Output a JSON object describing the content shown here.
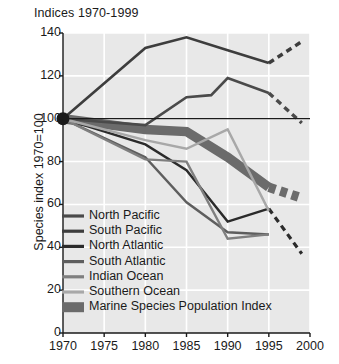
{
  "chart_data": {
    "type": "line",
    "title": "Indices 1970-1999",
    "xlabel": "",
    "ylabel": "Species index 1970=100",
    "xlim": [
      1970,
      2000
    ],
    "ylim": [
      0,
      140
    ],
    "grid": true,
    "grid_color": "#ffffff",
    "plot_background": "#e8e8e8",
    "legend_position": "inside-lower-left",
    "xticks": [
      1970,
      1975,
      1980,
      1985,
      1990,
      1995,
      2000
    ],
    "yticks": [
      0,
      20,
      40,
      60,
      80,
      100,
      120,
      140
    ],
    "reference_line": {
      "y": 100,
      "color": "#1a1a1a",
      "label": ""
    },
    "marker_points": [
      {
        "x": 1970,
        "y": 100,
        "color": "#1a1a1a"
      }
    ],
    "series": [
      {
        "name": "North Pacific",
        "color": "#4a4a4a",
        "width": 2.6,
        "x": [
          1970,
          1980,
          1985,
          1988,
          1990,
          1995
        ],
        "values": [
          100,
          97,
          110,
          111,
          119,
          112
        ],
        "projected_x": [
          1995,
          1999
        ],
        "projected_values": [
          112,
          98
        ],
        "projected_style": "dashed"
      },
      {
        "name": "South Pacific",
        "color": "#3d3d3d",
        "width": 2.6,
        "x": [
          1970,
          1980,
          1985,
          1990,
          1995
        ],
        "values": [
          100,
          133,
          138,
          132,
          126
        ],
        "projected_x": [
          1995,
          1999
        ],
        "projected_values": [
          126,
          136
        ],
        "projected_style": "dashed"
      },
      {
        "name": "North Atlantic",
        "color": "#2b2b2b",
        "width": 2.4,
        "x": [
          1970,
          1980,
          1985,
          1990,
          1995
        ],
        "values": [
          100,
          88,
          76,
          52,
          58
        ],
        "projected_x": [
          1995,
          1999
        ],
        "projected_values": [
          58,
          37
        ],
        "projected_style": "dashed"
      },
      {
        "name": "South Atlantic",
        "color": "#5e5e5e",
        "width": 2.4,
        "x": [
          1970,
          1980,
          1985,
          1990,
          1995
        ],
        "values": [
          100,
          82,
          61,
          47,
          46
        ],
        "projected_x": [],
        "projected_values": [],
        "projected_style": "none"
      },
      {
        "name": "Indian Ocean",
        "color": "#7f7f7f",
        "width": 2.4,
        "x": [
          1970,
          1980,
          1985,
          1990,
          1995
        ],
        "values": [
          100,
          81,
          80,
          44,
          46
        ],
        "projected_x": [],
        "projected_values": [],
        "projected_style": "none"
      },
      {
        "name": "Southern Ocean",
        "color": "#a8a8a8",
        "width": 2.4,
        "x": [
          1970,
          1980,
          1985,
          1990,
          1995
        ],
        "values": [
          100,
          90,
          86,
          95,
          57
        ],
        "projected_x": [],
        "projected_values": [],
        "projected_style": "none"
      }
    ],
    "index_band": {
      "name": "Marine Species Population Index",
      "color": "#6b6b6b",
      "width": 9.5,
      "x": [
        1970,
        1980,
        1985,
        1990,
        1995
      ],
      "values": [
        100,
        95,
        94,
        82,
        68
      ],
      "projected_x": [
        1995,
        1999
      ],
      "projected_values": [
        68,
        63
      ],
      "projected_style": "dashed"
    },
    "legend_entries": [
      {
        "label": "North Pacific",
        "color": "#4a4a4a",
        "swatch": "line"
      },
      {
        "label": "South Pacific",
        "color": "#3d3d3d",
        "swatch": "line"
      },
      {
        "label": "North Atlantic",
        "color": "#2b2b2b",
        "swatch": "line"
      },
      {
        "label": "South Atlantic",
        "color": "#5e5e5e",
        "swatch": "line"
      },
      {
        "label": "Indian Ocean",
        "color": "#7f7f7f",
        "swatch": "line"
      },
      {
        "label": "Southern Ocean",
        "color": "#a8a8a8",
        "swatch": "line"
      },
      {
        "label": "Marine Species Population Index",
        "color": "#6b6b6b",
        "swatch": "block"
      }
    ]
  }
}
